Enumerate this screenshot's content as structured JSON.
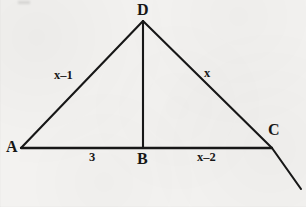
{
  "figure": {
    "background_color": "#f3f2f0",
    "ink_color": "#171717",
    "vertices": [
      {
        "id": "A",
        "label": "A",
        "x": 21,
        "y": 148
      },
      {
        "id": "B",
        "label": "B",
        "x": 143,
        "y": 148
      },
      {
        "id": "C",
        "label": "C",
        "x": 272,
        "y": 148
      },
      {
        "id": "D",
        "label": "D",
        "x": 143,
        "y": 21
      }
    ],
    "segments": [
      {
        "id": "AD",
        "from": "A",
        "to": "D",
        "label": "x–1"
      },
      {
        "id": "DC",
        "from": "D",
        "to": "C",
        "label": "x"
      },
      {
        "id": "AB",
        "from": "A",
        "to": "B",
        "label": "3"
      },
      {
        "id": "BC",
        "from": "B",
        "to": "C",
        "label": "x–2"
      },
      {
        "id": "DB",
        "from": "D",
        "to": "B",
        "label": ""
      }
    ],
    "extension": {
      "id": "DC-extended",
      "description": "ray from D through C continuing beyond C",
      "from_x": 272,
      "from_y": 148,
      "to_x": 301,
      "to_y": 189
    },
    "labels": {
      "vertex_a": "A",
      "vertex_b": "B",
      "vertex_c": "C",
      "vertex_d": "D",
      "side_ad": "x–1",
      "side_dc": "x",
      "base_ab": "3",
      "base_bc": "x–2"
    }
  }
}
